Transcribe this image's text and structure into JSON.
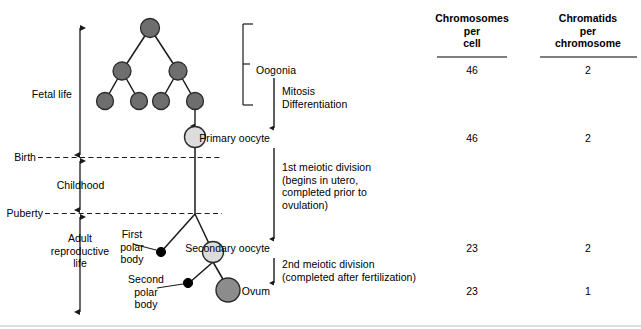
{
  "diagram": {
    "title_hidden": "Oogenesis",
    "timeline": {
      "stages": [
        {
          "key": "fetal-life",
          "label": "Fetal life"
        },
        {
          "key": "childhood",
          "label": "Childhood"
        },
        {
          "key": "adult-reproductive-life",
          "label": "Adult\nreproductive\nlife"
        }
      ],
      "markers": [
        {
          "key": "birth",
          "label": "Birth"
        },
        {
          "key": "puberty",
          "label": "Puberty"
        }
      ]
    },
    "cell_labels": [
      {
        "key": "first-polar-body",
        "label": "First\npolar\nbody"
      },
      {
        "key": "second-polar-body",
        "label": "Second\npolar\nbody"
      }
    ],
    "stages": [
      {
        "key": "oogonia",
        "label": "Oogonia"
      },
      {
        "key": "primary-oocyte",
        "label": "Primary oocyte"
      },
      {
        "key": "secondary-oocyte",
        "label": "Secondary oocyte"
      },
      {
        "key": "ovum",
        "label": "Ovum"
      }
    ],
    "processes": [
      {
        "key": "mitosis-differentiation",
        "label": "Mitosis\nDifferentiation"
      },
      {
        "key": "first-meiotic-division",
        "label": "1st meiotic division\n(begins in utero,\ncompleted prior to\novulation)"
      },
      {
        "key": "second-meiotic-division",
        "label": "2nd meiotic division\n(completed after fertilization)"
      }
    ],
    "colors": {
      "dark_cell": "#6e6e6e",
      "light_cell": "#dcdcdc",
      "ovum_cell": "#8c8c8c",
      "polar_body": "#000000",
      "stroke": "#1a1a1a"
    }
  },
  "table": {
    "columns": [
      {
        "key": "chromosomes-per-cell",
        "header": "Chromosomes\nper\ncell"
      },
      {
        "key": "chromatids-per-chromosome",
        "header": "Chromatids\nper\nchromosome"
      }
    ],
    "rows": [
      {
        "stage": "Oogonia",
        "chromosomes_per_cell": "46",
        "chromatids_per_chromosome": "2"
      },
      {
        "stage": "Primary oocyte",
        "chromosomes_per_cell": "46",
        "chromatids_per_chromosome": "2"
      },
      {
        "stage": "Secondary oocyte",
        "chromosomes_per_cell": "23",
        "chromatids_per_chromosome": "2"
      },
      {
        "stage": "Ovum",
        "chromosomes_per_cell": "23",
        "chromatids_per_chromosome": "1"
      }
    ]
  }
}
